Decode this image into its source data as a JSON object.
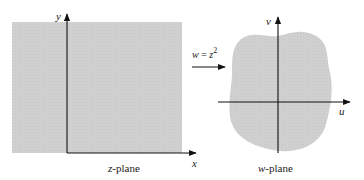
{
  "figure": {
    "mapping": {
      "label_lhs": "w",
      "label_eq": " = ",
      "label_rhs": "z",
      "label_exp": "2"
    },
    "z_plane": {
      "caption_var": "z",
      "caption_rest": "-plane",
      "x_axis_label": "x",
      "y_axis_label": "y",
      "region_description": "upper half-plane quadrant region (shaded rectangle)"
    },
    "w_plane": {
      "caption_var": "w",
      "caption_rest": "-plane",
      "u_axis_label": "u",
      "v_axis_label": "v",
      "region_description": "image region (shaded blob)"
    },
    "colors": {
      "region_fill": "#cfcfcf",
      "axis": "#111111",
      "text": "#222222"
    }
  }
}
